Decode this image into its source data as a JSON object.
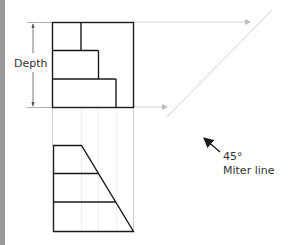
{
  "figure": {
    "type": "orthographic-projection-diagram",
    "labels": {
      "depth": "Depth",
      "angle": "45°",
      "miter": "Miter line"
    },
    "colors": {
      "object_line": "#1a1a1a",
      "projection_line": "#c8c8c8",
      "dimension_line": "#555555",
      "left_bar": "#9a9a9a"
    },
    "views": [
      {
        "name": "top-view",
        "shape": "square with stepped internal lines"
      },
      {
        "name": "front-view",
        "shape": "trapezoid with two horizontal divisions"
      }
    ]
  }
}
